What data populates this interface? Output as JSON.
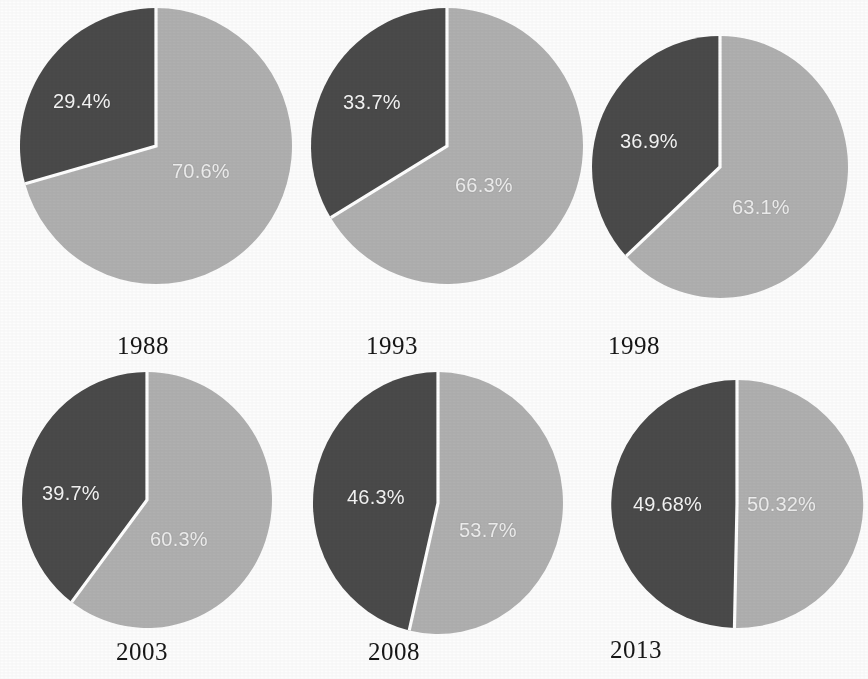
{
  "figure": {
    "type": "pie-grid",
    "rows": 2,
    "columns": 3,
    "background_color": "#fdfdfd",
    "slice_colors": {
      "dark": "#4a4a4a",
      "light": "#b0b0b0",
      "separator": "#ffffff"
    },
    "label_color_on_slice": "#f4f4f4",
    "year_label_color": "#161616"
  },
  "chart_data": {
    "type": "pie",
    "title": "",
    "xlabel": "",
    "ylabel": "",
    "legend": [],
    "series_names": [
      "dark",
      "light"
    ],
    "panels": [
      {
        "year": "1988",
        "categories": [
          "dark",
          "light"
        ],
        "values": [
          29.4,
          70.6
        ],
        "labels": [
          "29.4%",
          "70.6%"
        ]
      },
      {
        "year": "1993",
        "categories": [
          "dark",
          "light"
        ],
        "values": [
          33.7,
          66.3
        ],
        "labels": [
          "33.7%",
          "66.3%"
        ]
      },
      {
        "year": "1998",
        "categories": [
          "dark",
          "light"
        ],
        "values": [
          36.9,
          63.1
        ],
        "labels": [
          "36.9%",
          "63.1%"
        ]
      },
      {
        "year": "2003",
        "categories": [
          "dark",
          "light"
        ],
        "values": [
          39.7,
          60.3
        ],
        "labels": [
          "39.7%",
          "60.3%"
        ]
      },
      {
        "year": "2008",
        "categories": [
          "dark",
          "light"
        ],
        "values": [
          46.3,
          53.7
        ],
        "labels": [
          "46.3%",
          "53.7%"
        ]
      },
      {
        "year": "2013",
        "categories": [
          "dark",
          "light"
        ],
        "values": [
          49.68,
          50.32
        ],
        "labels": [
          "49.68%",
          "50.32%"
        ]
      }
    ]
  },
  "panels": {
    "p1": {
      "year": "1988",
      "dark_label": "29.4%",
      "light_label": "70.6%"
    },
    "p2": {
      "year": "1993",
      "dark_label": "33.7%",
      "light_label": "66.3%"
    },
    "p3": {
      "year": "1998",
      "dark_label": "36.9%",
      "light_label": "63.1%"
    },
    "p4": {
      "year": "2003",
      "dark_label": "39.7%",
      "light_label": "60.3%"
    },
    "p5": {
      "year": "2008",
      "dark_label": "46.3%",
      "light_label": "53.7%"
    },
    "p6": {
      "year": "2013",
      "dark_label": "49.68%",
      "light_label": "50.32%"
    }
  }
}
